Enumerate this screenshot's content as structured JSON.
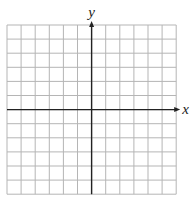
{
  "figure": {
    "type": "coordinate-grid",
    "x_axis_label": "x",
    "y_axis_label": "y",
    "grid": {
      "columns": 12,
      "rows": 12,
      "left": 7,
      "top": 25,
      "cell": 14.1
    },
    "origin": {
      "col": 6,
      "row": 6
    },
    "colors": {
      "grid": "#b5b5b5",
      "axis": "#222222",
      "background": "#ffffff"
    }
  }
}
